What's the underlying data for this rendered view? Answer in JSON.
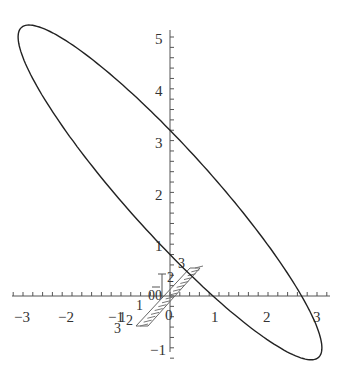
{
  "chart_data": {
    "type": "line",
    "title": "",
    "xlabel": "",
    "ylabel": "",
    "xlim": [
      -3.3,
      3.3
    ],
    "ylim": [
      -1.2,
      5.3
    ],
    "grid": false,
    "legend": null,
    "x_ticks": [
      "-3",
      "-2",
      "-1",
      "0",
      "1",
      "2",
      "3"
    ],
    "y_ticks": [
      "-1",
      "1",
      "2",
      "3",
      "4",
      "5"
    ],
    "series": [
      {
        "name": "ellipse",
        "description": "closed ellipse curve, center approx (0, 2), tilted from upper-left to lower-right",
        "parametric": "x = 3.1*cos(t), y = 2 - 3*cos(t) + 1.2*sin(t)",
        "key_points": [
          {
            "label": "top",
            "x": -2.9,
            "y": 5.15
          },
          {
            "label": "left",
            "x": -3.15,
            "y": 4.85
          },
          {
            "label": "bottom",
            "x": 2.85,
            "y": -1.1
          },
          {
            "label": "right",
            "x": 3.15,
            "y": -0.75
          },
          {
            "label": "y-axis upper crossing",
            "x": 0,
            "y": 3.24
          },
          {
            "label": "y-axis lower crossing",
            "x": 0,
            "y": 0.81
          },
          {
            "label": "x-axis crossing left",
            "x": 1.0,
            "y": 0
          },
          {
            "label": "x-axis crossing right",
            "x": 2.95,
            "y": 0
          }
        ],
        "color": "#222222"
      }
    ],
    "annotations": {
      "inset_3d_axes_labels": [
        "3",
        "2",
        "1",
        "0",
        "0",
        "-1",
        "2",
        "1",
        "3",
        "0"
      ],
      "hatched_shading": "small diagonal hatched band from about (-0.6,-0.55) to (0.7,0.6)"
    }
  },
  "axes": {
    "x_tick_labels": [
      "−3",
      "−2",
      "−1",
      "0",
      "1",
      "2",
      "3"
    ],
    "y_tick_labels": [
      "5",
      "4",
      "3",
      "2",
      "1",
      "−1"
    ]
  },
  "inset": {
    "labels": [
      "3",
      "2",
      "1",
      "0",
      "0",
      "1",
      "2",
      "3",
      "−"
    ]
  }
}
